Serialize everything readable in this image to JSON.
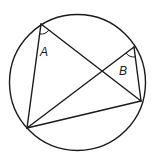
{
  "diagram": {
    "angle_labels": {
      "A": "A",
      "B": "B"
    },
    "colors": {
      "stroke": "#1a1a1a",
      "background": "#ffffff"
    }
  }
}
